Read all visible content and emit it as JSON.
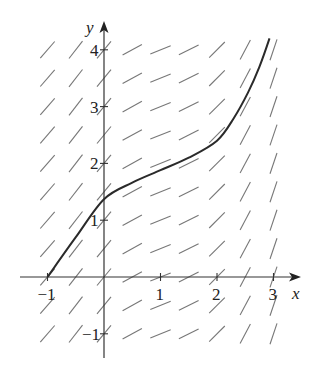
{
  "figure": {
    "type": "slope_field",
    "colors": {
      "axes": "#333333",
      "segments": "#777777",
      "curve": "#2a2a2a",
      "text": "#222222"
    },
    "axes": {
      "x_label": "x",
      "y_label": "y",
      "x_ticks": [
        {
          "value": -1,
          "label": "−1"
        },
        {
          "value": 1,
          "label": "1"
        },
        {
          "value": 2,
          "label": "2"
        },
        {
          "value": 3,
          "label": "3"
        }
      ],
      "y_ticks": [
        {
          "value": -1,
          "label": "−1"
        },
        {
          "value": 1,
          "label": "1"
        },
        {
          "value": 2,
          "label": "2"
        },
        {
          "value": 3,
          "label": "3"
        },
        {
          "value": 4,
          "label": "4"
        }
      ],
      "xlim": [
        -1.5,
        3.4
      ],
      "ylim": [
        -1.5,
        4.5
      ]
    },
    "grid": {
      "x_values": [
        -1,
        -0.5,
        0,
        0.5,
        1,
        1.5,
        2,
        2.5,
        3
      ],
      "y_values": [
        -1,
        -0.5,
        0,
        0.5,
        1,
        1.5,
        2,
        2.5,
        3,
        3.5,
        4
      ],
      "slopes_by_column": [
        1.15,
        1.3,
        1.2,
        0.55,
        0.4,
        0.5,
        1.0,
        1.9,
        3.0
      ]
    },
    "solution_curve": {
      "points": [
        [
          -1,
          0
        ],
        [
          -0.5,
          0.7
        ],
        [
          0,
          1.37
        ],
        [
          0.5,
          1.66
        ],
        [
          1,
          1.88
        ],
        [
          1.5,
          2.1
        ],
        [
          2,
          2.4
        ],
        [
          2.3,
          2.8
        ],
        [
          2.55,
          3.25
        ],
        [
          2.75,
          3.7
        ],
        [
          2.93,
          4.2
        ]
      ]
    }
  }
}
